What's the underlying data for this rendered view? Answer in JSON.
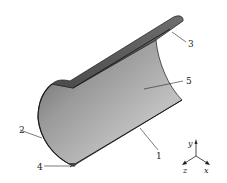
{
  "diagram": {
    "type": "half-cylinder shell",
    "callouts": [
      {
        "id": "1",
        "label": "1"
      },
      {
        "id": "2",
        "label": "2"
      },
      {
        "id": "3",
        "label": "3"
      },
      {
        "id": "4",
        "label": "4"
      },
      {
        "id": "5",
        "label": "5"
      }
    ],
    "axes": {
      "y": "y",
      "z": "z",
      "x": "x"
    },
    "colors": {
      "surface_light": "#b9b9b9",
      "surface_dark": "#6a6a6a",
      "edge": "#2a2a2a",
      "background": "#ffffff"
    }
  }
}
